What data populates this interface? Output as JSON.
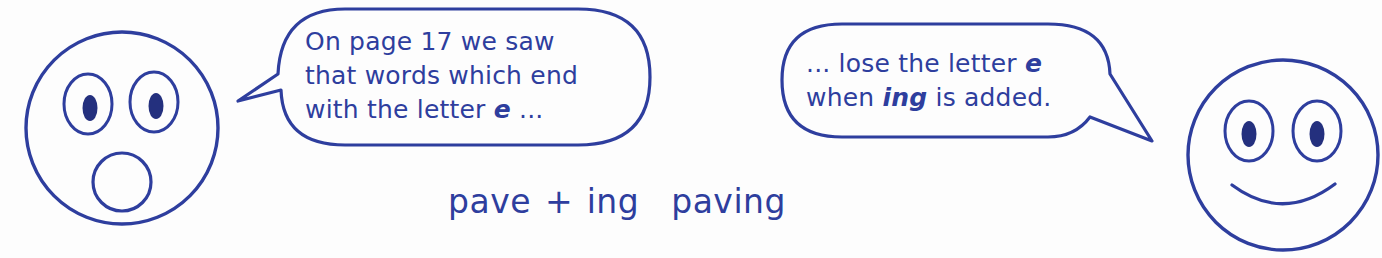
{
  "scene": {
    "title": "Spelling rule: drop the e before adding ing",
    "background_color": "#fdfdfd",
    "ink_color": "#2e3e9e",
    "pupil_color": "#24307e"
  },
  "left_character": {
    "name": "surprised-face",
    "expression": "surprised",
    "eyes": "two oval eyes with round pupils",
    "mouth": "small open circle"
  },
  "right_character": {
    "name": "smiling-face",
    "expression": "smiling",
    "eyes": "two oval eyes with round pupils",
    "mouth": "upward curved smile"
  },
  "bubble_one": {
    "speaker": "surprised-face",
    "tail_direction": "left",
    "lines": [
      "On page 17 we saw",
      "that words which end",
      "with the letter "
    ],
    "emphasis": "e",
    "trailing": " ..."
  },
  "bubble_two": {
    "speaker": "smiling-face",
    "tail_direction": "right",
    "line_one_prefix": "... lose the letter ",
    "line_one_emphasis": "e",
    "line_two_prefix": "when ",
    "line_two_emphasis": "ing",
    "line_two_suffix": " is added."
  },
  "equation": {
    "base_word": "pave",
    "operator": "+",
    "suffix": "ing",
    "arrow": "→",
    "result": "paving"
  }
}
